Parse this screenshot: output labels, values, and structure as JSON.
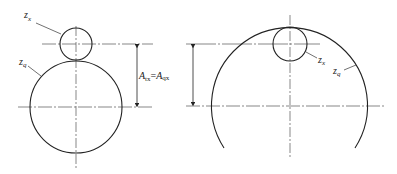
{
  "diagram": {
    "title": "",
    "left": {
      "small_label": "z",
      "small_sub": "x",
      "large_label": "z",
      "large_sub": "q",
      "dimension_label_A1": "A",
      "dimension_sub1": "tx",
      "dimension_eq": "=",
      "dimension_label_A2": "A",
      "dimension_sub2": "qx"
    },
    "right": {
      "small_label": "z",
      "small_sub": "x",
      "large_label": "z",
      "large_sub": "q"
    },
    "colors": {
      "line": "#222222",
      "centerline": "#555555"
    }
  }
}
